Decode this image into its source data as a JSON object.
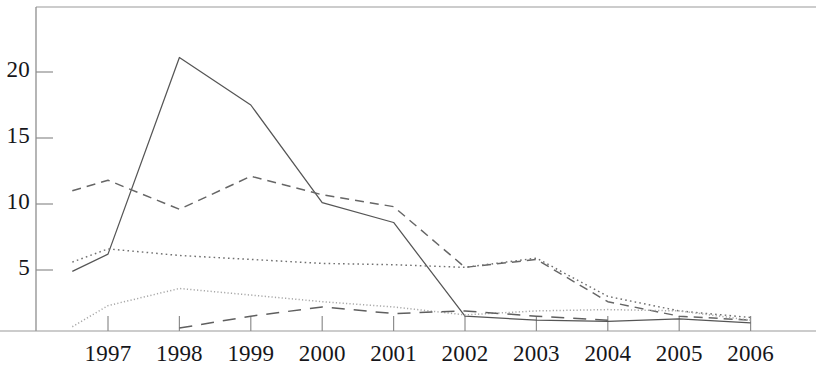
{
  "chart_data": {
    "type": "line",
    "title": "",
    "subtitle": "",
    "xlabel": "",
    "ylabel": "",
    "grid": false,
    "legend_position": "none",
    "x": [
      1996.5,
      1997,
      1998,
      1999,
      2000,
      2001,
      2002,
      2003,
      2004,
      2005,
      2006
    ],
    "categories": [
      "1997",
      "1998",
      "1999",
      "2000",
      "2001",
      "2002",
      "2003",
      "2004",
      "2005",
      "2006"
    ],
    "xtick_labels": [
      "1997",
      "1998",
      "1999",
      "2000",
      "2001",
      "2002",
      "2003",
      "2004",
      "2005",
      "2006"
    ],
    "ytick_labels": [
      "5",
      "10",
      "15",
      "20"
    ],
    "ytick_values": [
      5,
      10,
      15,
      20
    ],
    "ylim": [
      0,
      25.0
    ],
    "xlim": [
      1996.5,
      2006.6
    ],
    "series": [
      {
        "name": "series-solid",
        "style": "solid",
        "color": "#555555",
        "x": [
          1996.5,
          1997,
          1998,
          1999,
          2000,
          2001,
          2002,
          2003,
          2004,
          2005,
          2006
        ],
        "values": [
          4.9,
          6.2,
          21.1,
          17.5,
          10.1,
          8.6,
          1.5,
          1.2,
          1.1,
          1.3,
          1.0
        ]
      },
      {
        "name": "series-dashed",
        "style": "dashed",
        "color": "#666666",
        "x": [
          1996.5,
          1997,
          1998,
          1999,
          2000,
          2001,
          2002,
          2003,
          2004,
          2005,
          2006
        ],
        "values": [
          11.0,
          11.8,
          9.6,
          12.1,
          10.7,
          9.8,
          5.2,
          5.8,
          2.6,
          1.5,
          1.2
        ]
      },
      {
        "name": "series-dotted",
        "style": "dotted",
        "color": "#707070",
        "x": [
          1996.5,
          1997,
          1998,
          1999,
          2000,
          2001,
          2002,
          2003,
          2004,
          2005,
          2006
        ],
        "values": [
          5.6,
          6.6,
          6.1,
          5.8,
          5.5,
          5.4,
          5.2,
          5.9,
          3.0,
          1.9,
          1.4
        ]
      },
      {
        "name": "series-light-dotted",
        "style": "fine-dotted",
        "color": "#a8a8a8",
        "x": [
          1996.5,
          1997,
          1998,
          1999,
          2000,
          2001,
          2002,
          2003,
          2004,
          2005,
          2006
        ],
        "values": [
          0.7,
          2.3,
          3.6,
          3.1,
          2.6,
          2.2,
          1.6,
          1.9,
          2.0,
          1.9,
          1.2
        ]
      },
      {
        "name": "series-long-dash",
        "style": "long-dash",
        "color": "#5f5f5f",
        "x": [
          1998,
          1999,
          2000,
          2001,
          2002,
          2003,
          2004
        ],
        "values": [
          0.6,
          1.5,
          2.2,
          1.7,
          1.9,
          1.5,
          1.2
        ]
      }
    ]
  },
  "axes": {
    "left_axis_x_px": 36,
    "bottom_axis_y_px": 330,
    "top_border_y_px": 7,
    "right_edge_px": 816,
    "y_value_at_px": {
      "v5": 270,
      "v20": 72
    },
    "x_px_1997": 108,
    "x_spacing_px": 71.4
  }
}
